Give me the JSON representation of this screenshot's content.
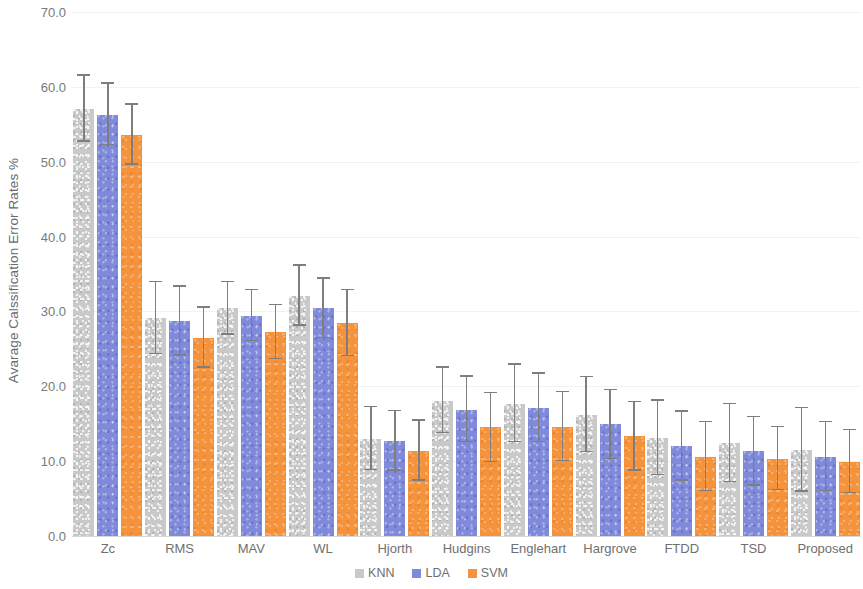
{
  "chart_data": {
    "type": "bar",
    "title": "",
    "xlabel": "",
    "ylabel": "Avarage Calssification Error Rates %",
    "ylim": [
      0,
      70
    ],
    "ytick_step": 10,
    "ytick_labels": [
      "70.0",
      "60.0",
      "50.0",
      "40.0",
      "30.0",
      "20.0",
      "10.0",
      "0.0"
    ],
    "grid": true,
    "legend_position": "bottom-center",
    "error_bars": "symmetric std-dev whiskers",
    "categories": [
      "Zc",
      "RMS",
      "MAV",
      "WL",
      "Hjorth",
      "Hudgins",
      "Englehart",
      "Hargrove",
      "FTDD",
      "TSD",
      "Proposed"
    ],
    "series": [
      {
        "name": "KNN",
        "color": "#c9c9c9",
        "values": [
          57.1,
          29.1,
          30.4,
          32.1,
          13.0,
          18.1,
          17.7,
          16.2,
          13.1,
          12.4,
          11.5
        ],
        "errors": [
          4.4,
          4.8,
          3.5,
          4.0,
          4.2,
          4.4,
          5.2,
          5.0,
          5.0,
          5.2,
          5.6
        ]
      },
      {
        "name": "LDA",
        "color": "#7f8ada",
        "values": [
          56.3,
          28.7,
          29.4,
          30.4,
          12.7,
          16.9,
          17.1,
          14.9,
          12.0,
          11.3,
          10.6
        ],
        "errors": [
          4.1,
          4.6,
          3.4,
          4.0,
          4.0,
          4.4,
          4.6,
          4.6,
          4.6,
          4.6,
          4.6
        ]
      },
      {
        "name": "SVM",
        "color": "#f5933c",
        "values": [
          53.6,
          26.5,
          27.2,
          28.4,
          11.4,
          14.5,
          14.6,
          13.3,
          10.6,
          10.3,
          9.9
        ],
        "errors": [
          4.0,
          4.0,
          3.6,
          4.4,
          4.0,
          4.6,
          4.6,
          4.6,
          4.6,
          4.2,
          4.2
        ]
      }
    ]
  },
  "legend": {
    "items": [
      {
        "label": "KNN",
        "color": "#c9c9c9"
      },
      {
        "label": "LDA",
        "color": "#7f8ada"
      },
      {
        "label": "SVM",
        "color": "#f5933c"
      }
    ]
  }
}
